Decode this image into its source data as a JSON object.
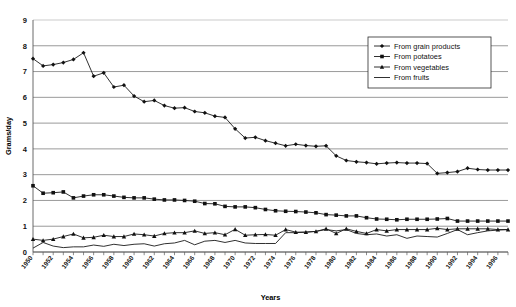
{
  "chart_data": {
    "type": "line",
    "title": "",
    "xlabel": "Years",
    "ylabel": "Grams/day",
    "xlim": [
      1950,
      1997
    ],
    "ylim": [
      0,
      9
    ],
    "yticks": [
      0,
      1,
      2,
      3,
      4,
      5,
      6,
      7,
      8,
      9
    ],
    "xticks_labeled": [
      1950,
      1952,
      1954,
      1956,
      1958,
      1960,
      1962,
      1964,
      1966,
      1968,
      1970,
      1972,
      1974,
      1976,
      1978,
      1980,
      1982,
      1984,
      1986,
      1988,
      1990,
      1992,
      1994,
      1996
    ],
    "grid": "horizontal",
    "legend_position": "top-right",
    "x": [
      1950,
      1951,
      1952,
      1953,
      1954,
      1955,
      1956,
      1957,
      1958,
      1959,
      1960,
      1961,
      1962,
      1963,
      1964,
      1965,
      1966,
      1967,
      1968,
      1969,
      1970,
      1971,
      1972,
      1973,
      1974,
      1975,
      1976,
      1977,
      1978,
      1979,
      1980,
      1981,
      1982,
      1983,
      1984,
      1985,
      1986,
      1987,
      1988,
      1989,
      1990,
      1991,
      1992,
      1993,
      1994,
      1995,
      1996,
      1997
    ],
    "series": [
      {
        "name": "From grain products",
        "marker": "diamond",
        "values": [
          7.5,
          7.22,
          7.27,
          7.35,
          7.47,
          7.73,
          6.82,
          6.95,
          6.4,
          6.47,
          6.05,
          5.83,
          5.88,
          5.68,
          5.58,
          5.6,
          5.45,
          5.4,
          5.27,
          5.22,
          4.78,
          4.42,
          4.45,
          4.32,
          4.22,
          4.12,
          4.18,
          4.13,
          4.1,
          4.12,
          3.73,
          3.55,
          3.5,
          3.47,
          3.42,
          3.45,
          3.47,
          3.45,
          3.45,
          3.43,
          3.05,
          3.08,
          3.12,
          3.25,
          3.2,
          3.18,
          3.18,
          3.18
        ]
      },
      {
        "name": "From potatoes",
        "marker": "square",
        "values": [
          2.57,
          2.28,
          2.3,
          2.33,
          2.1,
          2.17,
          2.22,
          2.22,
          2.17,
          2.12,
          2.1,
          2.1,
          2.05,
          2.02,
          2.02,
          2.0,
          1.97,
          1.88,
          1.87,
          1.77,
          1.75,
          1.75,
          1.72,
          1.65,
          1.6,
          1.58,
          1.57,
          1.55,
          1.52,
          1.45,
          1.43,
          1.4,
          1.4,
          1.33,
          1.28,
          1.27,
          1.25,
          1.27,
          1.27,
          1.27,
          1.28,
          1.3,
          1.2,
          1.2,
          1.2,
          1.2,
          1.2,
          1.2
        ]
      },
      {
        "name": "From vegetables",
        "marker": "triangle",
        "values": [
          0.5,
          0.45,
          0.5,
          0.6,
          0.7,
          0.55,
          0.57,
          0.65,
          0.6,
          0.6,
          0.7,
          0.67,
          0.62,
          0.72,
          0.75,
          0.75,
          0.82,
          0.72,
          0.75,
          0.67,
          0.88,
          0.65,
          0.67,
          0.68,
          0.65,
          0.87,
          0.77,
          0.77,
          0.8,
          0.9,
          0.72,
          0.9,
          0.8,
          0.72,
          0.87,
          0.82,
          0.87,
          0.87,
          0.87,
          0.87,
          0.92,
          0.87,
          0.9,
          0.9,
          0.9,
          0.9,
          0.87,
          0.87
        ]
      },
      {
        "name": "From fruits",
        "marker": "none",
        "values": [
          0.15,
          0.37,
          0.23,
          0.17,
          0.2,
          0.2,
          0.27,
          0.22,
          0.3,
          0.25,
          0.3,
          0.32,
          0.23,
          0.32,
          0.35,
          0.45,
          0.28,
          0.42,
          0.45,
          0.37,
          0.45,
          0.35,
          0.33,
          0.33,
          0.33,
          0.75,
          0.75,
          0.77,
          0.8,
          0.87,
          0.82,
          0.87,
          0.72,
          0.67,
          0.7,
          0.62,
          0.67,
          0.53,
          0.62,
          0.6,
          0.58,
          0.72,
          0.87,
          0.67,
          0.75,
          0.82,
          0.85,
          0.87
        ]
      }
    ]
  },
  "legend": {
    "items": [
      {
        "label": "From grain products"
      },
      {
        "label": "From potatoes"
      },
      {
        "label": "From vegetables"
      },
      {
        "label": "From fruits"
      }
    ]
  },
  "colors": {
    "series": "#1a1a1a",
    "grid": "#808080",
    "axis": "#5a5a5a",
    "background": "#ffffff"
  }
}
